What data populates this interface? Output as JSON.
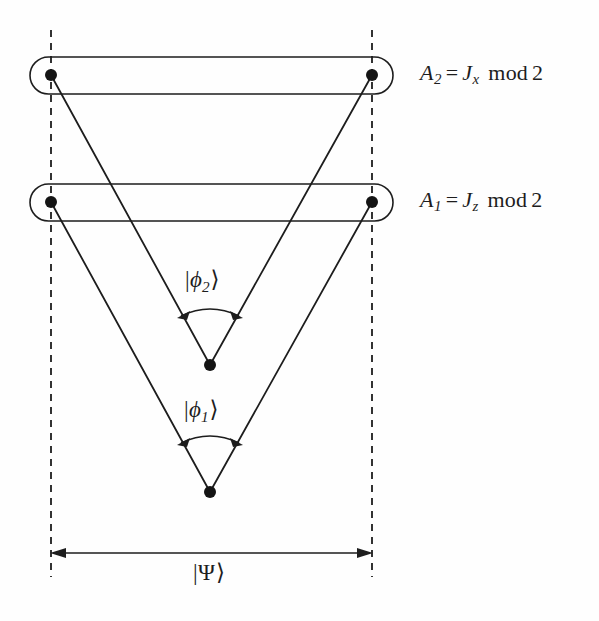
{
  "figure": {
    "kind": "quantum-measurement-tree-diagram",
    "background_color": "#fefefe",
    "ink_color": "#1d1d1d"
  },
  "observables": [
    {
      "id": "A2",
      "name": "A_2",
      "label_parts": {
        "lhs_var": "A",
        "lhs_sub": "2",
        "equals": "=",
        "rhs_var": "J",
        "rhs_sub": "x",
        "operator": "mod",
        "modulus": "2"
      },
      "label_text": "A2 = Jx  mod 2",
      "box": {
        "x": 30,
        "y": 57,
        "width": 363,
        "height": 37,
        "radius": 18.5
      },
      "dots": [
        {
          "cx": 51,
          "cy": 75,
          "r": 6
        },
        {
          "cx": 372,
          "cy": 75,
          "r": 6
        }
      ]
    },
    {
      "id": "A1",
      "name": "A_1",
      "label_parts": {
        "lhs_var": "A",
        "lhs_sub": "1",
        "equals": "=",
        "rhs_var": "J",
        "rhs_sub": "z",
        "operator": "mod",
        "modulus": "2"
      },
      "label_text": "A1 = Jz  mod 2",
      "box": {
        "x": 30,
        "y": 184,
        "width": 363,
        "height": 37,
        "radius": 18.5
      },
      "dots": [
        {
          "cx": 51,
          "cy": 202,
          "r": 6
        },
        {
          "cx": 372,
          "cy": 202,
          "r": 6
        }
      ]
    }
  ],
  "vertices": [
    {
      "id": "phi2-vertex",
      "cx": 210,
      "cy": 365,
      "r": 6
    },
    {
      "id": "phi1-vertex",
      "cx": 210,
      "cy": 492,
      "r": 6
    }
  ],
  "edges": [
    {
      "id": "edge-A2-left-to-phi2",
      "x1": 51,
      "y1": 75,
      "x2": 210,
      "y2": 365
    },
    {
      "id": "edge-A2-right-to-phi2",
      "x1": 372,
      "y1": 75,
      "x2": 210,
      "y2": 365
    },
    {
      "id": "edge-A1-left-to-phi1",
      "x1": 51,
      "y1": 202,
      "x2": 210,
      "y2": 492
    },
    {
      "id": "edge-A1-right-to-phi1",
      "x1": 372,
      "y1": 202,
      "x2": 210,
      "y2": 492
    }
  ],
  "angle_arcs": [
    {
      "id": "arc-phi2",
      "label": "|phi_2>",
      "label_bar": "|",
      "label_phi": "ϕ",
      "label_sub": "2",
      "label_angle": "⟩",
      "path": "M 179 317 Q 210 303 241 317",
      "arrow_left": {
        "x": 179,
        "y": 317,
        "angle": -155
      },
      "arrow_right": {
        "x": 241,
        "y": 317,
        "angle": -25
      }
    },
    {
      "id": "arc-phi1",
      "label": "|phi_1>",
      "label_bar": "|",
      "label_phi": "ϕ",
      "label_sub": "1",
      "label_angle": "⟩",
      "path": "M 179 444 Q 210 430 241 444",
      "arrow_left": {
        "x": 179,
        "y": 444,
        "angle": -155
      },
      "arrow_right": {
        "x": 241,
        "y": 444,
        "angle": -25
      }
    }
  ],
  "guides": [
    {
      "id": "dashed-left",
      "x": 51,
      "y1": 30,
      "y2": 577
    },
    {
      "id": "dashed-right",
      "x": 372,
      "y": 0,
      "y1": 30,
      "y2": 577
    }
  ],
  "span_measure": {
    "id": "psi-span",
    "label_bar": "|",
    "label_symbol": "Ψ",
    "label_angle": "⟩",
    "label_text": "|Ψ⟩",
    "y": 553,
    "x_start": 51,
    "x_end": 372
  },
  "strokes": {
    "box_width": 1.6,
    "edge_width": 1.8,
    "dashed_width": 1.8,
    "dash_pattern": "7 6",
    "arc_width": 1.6,
    "arrow_width": 1.6
  }
}
